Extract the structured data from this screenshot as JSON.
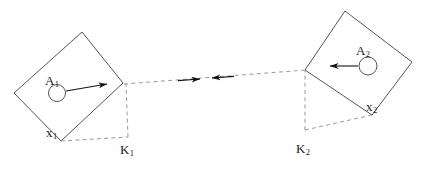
{
  "figure": {
    "background_color": "#ffffff",
    "solid_stroke_color": "#555555",
    "dashed_stroke_color": "#9a9a9a",
    "arrow_color": "#111111",
    "text_color": "#1a1a1a",
    "width": 426,
    "height": 179
  },
  "bodies": [
    {
      "id": "body-1",
      "name": "left-square",
      "vertices": [
        [
          82,
          32
        ],
        [
          123,
          83
        ],
        [
          61,
          141
        ],
        [
          14,
          93
        ]
      ],
      "center_circle": {
        "cx": 57,
        "cy": 93,
        "r": 8.5
      },
      "force_arrow": {
        "x1": 66,
        "y1": 91,
        "x2": 107,
        "y2": 84
      },
      "labels": {
        "point_mass": {
          "base": "A",
          "sub": "1",
          "x": 45,
          "y": 72
        },
        "contact_point": {
          "base": "x",
          "sub": "1",
          "x": 46,
          "y": 124
        },
        "reference_point": {
          "base": "K",
          "sub": "1",
          "x": 120,
          "y": 141
        }
      },
      "dashed_edges": [
        {
          "from": [
            61,
            141
          ],
          "to": [
            128,
            137
          ]
        },
        {
          "from": [
            128,
            137
          ],
          "to": [
            126,
            84
          ]
        }
      ],
      "reference_vertex": [
        128,
        137
      ]
    },
    {
      "id": "body-2",
      "name": "right-square",
      "vertices": [
        [
          345,
          11
        ],
        [
          412,
          62
        ],
        [
          372,
          115
        ],
        [
          305,
          70
        ]
      ],
      "center_circle": {
        "cx": 368,
        "cy": 66,
        "r": 9
      },
      "force_arrow": {
        "x1": 358,
        "y1": 66,
        "x2": 330,
        "y2": 66
      },
      "labels": {
        "point_mass": {
          "base": "A",
          "sub": "2",
          "x": 356,
          "y": 42
        },
        "contact_point": {
          "base": "x",
          "sub": "2",
          "x": 366,
          "y": 98
        },
        "reference_point": {
          "base": "K",
          "sub": "2",
          "x": 296,
          "y": 140
        }
      },
      "dashed_edges": [
        {
          "from": [
            372,
            115
          ],
          "to": [
            305,
            130
          ]
        },
        {
          "from": [
            305,
            130
          ],
          "to": [
            305,
            71
          ]
        }
      ],
      "reference_vertex": [
        305,
        130
      ]
    }
  ],
  "connector": {
    "name": "interaction-line",
    "from": [
      124,
      84
    ],
    "to": [
      306,
      70
    ],
    "style": "dashed",
    "arrowheads": [
      {
        "name": "arrowhead-right",
        "tip": [
          200,
          79
        ],
        "direction": "right"
      },
      {
        "name": "arrowhead-left",
        "tip": [
          212,
          78
        ],
        "direction": "left"
      }
    ]
  }
}
